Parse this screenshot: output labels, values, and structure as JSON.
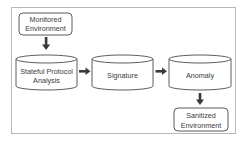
{
  "diagram": {
    "type": "flowchart",
    "nodes": [
      {
        "id": "monitored",
        "shape": "rounded-rect",
        "lines": [
          "Monitored",
          "Environment"
        ]
      },
      {
        "id": "stateful",
        "shape": "cylinder",
        "lines": [
          "Stateful Protocol",
          "Analysis"
        ]
      },
      {
        "id": "signature",
        "shape": "cylinder",
        "lines": [
          "Signature"
        ]
      },
      {
        "id": "anomaly",
        "shape": "cylinder",
        "lines": [
          "Anomaly"
        ]
      },
      {
        "id": "sanitized",
        "shape": "rounded-rect",
        "lines": [
          "Sanitized",
          "Environment"
        ]
      }
    ],
    "edges": [
      {
        "from": "monitored",
        "to": "stateful",
        "direction": "down"
      },
      {
        "from": "stateful",
        "to": "signature",
        "direction": "right"
      },
      {
        "from": "signature",
        "to": "anomaly",
        "direction": "right"
      },
      {
        "from": "anomaly",
        "to": "sanitized",
        "direction": "down"
      }
    ],
    "colors": {
      "stroke": "#4a4a4a",
      "arrow": "#3a3a3a",
      "text": "#3a3a3a",
      "frame": "#b8b8b8",
      "fill": "#ffffff"
    }
  }
}
